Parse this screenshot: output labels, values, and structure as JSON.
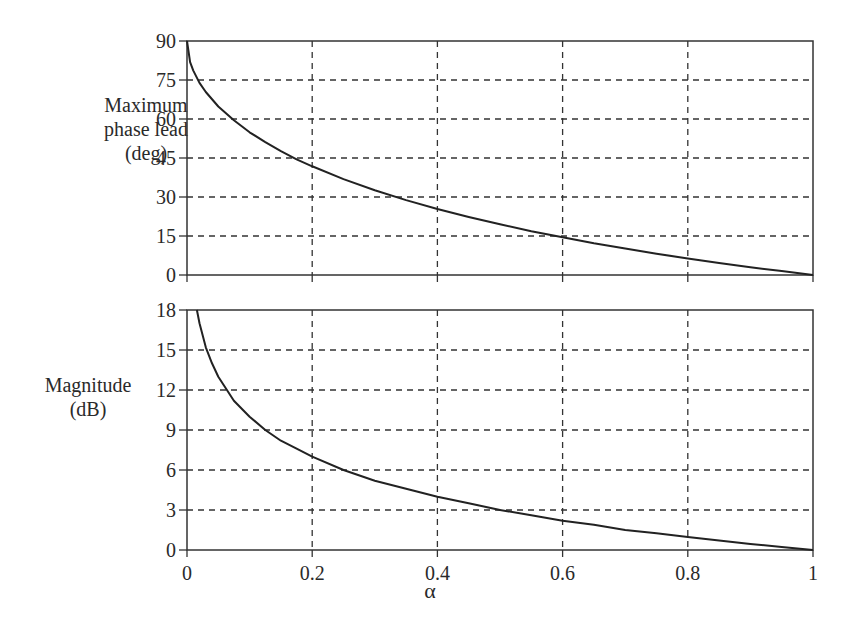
{
  "chart_data": [
    {
      "type": "line",
      "title": "",
      "xlabel": "",
      "ylabel": "Maximum phase lead (deg)",
      "ylabel_lines": [
        "Maximum",
        "phase lead",
        "(deg)"
      ],
      "xlim": [
        0,
        1
      ],
      "ylim": [
        0,
        90
      ],
      "yticks": [
        0,
        15,
        30,
        45,
        60,
        75,
        90
      ],
      "xticks": [
        0,
        0.2,
        0.4,
        0.6,
        0.8,
        1
      ],
      "grid": true,
      "x": [
        0,
        0.005,
        0.01,
        0.02,
        0.03,
        0.05,
        0.075,
        0.1,
        0.125,
        0.15,
        0.175,
        0.2,
        0.25,
        0.3,
        0.35,
        0.4,
        0.45,
        0.5,
        0.55,
        0.6,
        0.65,
        0.7,
        0.75,
        0.8,
        0.85,
        0.9,
        0.95,
        1.0
      ],
      "series": [
        {
          "name": "Maximum phase lead",
          "values": [
            90,
            81.9,
            78.6,
            73.9,
            70.4,
            64.8,
            59.5,
            54.9,
            51.1,
            47.6,
            44.5,
            41.8,
            36.9,
            32.6,
            28.8,
            25.4,
            22.3,
            19.5,
            16.8,
            14.5,
            12.2,
            10.2,
            8.2,
            6.4,
            4.6,
            3.0,
            1.5,
            0
          ]
        }
      ]
    },
    {
      "type": "line",
      "title": "",
      "xlabel": "α",
      "ylabel": "Magnitude (dB)",
      "ylabel_lines": [
        "Magnitude",
        "(dB)"
      ],
      "xlim": [
        0,
        1
      ],
      "ylim": [
        0,
        18
      ],
      "yticks": [
        0,
        3,
        6,
        9,
        12,
        15,
        18
      ],
      "xticks": [
        0,
        0.2,
        0.4,
        0.6,
        0.8,
        1
      ],
      "xtick_labels": [
        "0",
        "0.2",
        "0.4",
        "0.6",
        "0.8",
        "1"
      ],
      "grid": true,
      "x": [
        0.0158,
        0.02,
        0.03,
        0.04,
        0.05,
        0.075,
        0.1,
        0.125,
        0.15,
        0.175,
        0.2,
        0.25,
        0.3,
        0.35,
        0.4,
        0.45,
        0.5,
        0.55,
        0.6,
        0.65,
        0.7,
        0.75,
        0.8,
        0.85,
        0.9,
        0.95,
        1.0
      ],
      "series": [
        {
          "name": "Magnitude",
          "values": [
            18.0,
            17.0,
            15.2,
            14.0,
            13.0,
            11.2,
            10.0,
            9.0,
            8.2,
            7.6,
            7.0,
            6.0,
            5.2,
            4.6,
            4.0,
            3.5,
            3.0,
            2.6,
            2.2,
            1.9,
            1.5,
            1.25,
            0.97,
            0.71,
            0.46,
            0.22,
            0
          ]
        }
      ]
    }
  ],
  "labels": {
    "top_ylabel": [
      "Maximum",
      "phase lead",
      "(deg)"
    ],
    "bottom_ylabel": [
      "Magnitude",
      "(dB)"
    ],
    "xaxis_symbol": "α"
  },
  "style": {
    "line_color": "#222222",
    "grid_color": "#333333",
    "axis_color": "#333333",
    "text_color": "#2a2a2a"
  }
}
